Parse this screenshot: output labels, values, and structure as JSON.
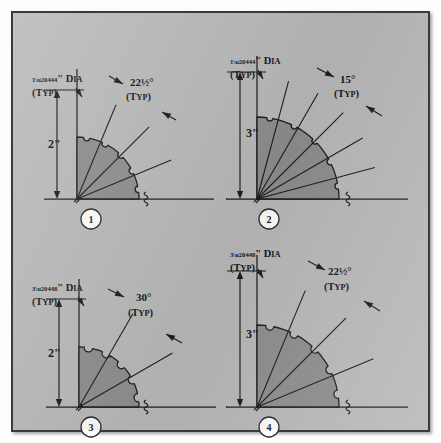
{
  "figure": {
    "background_color": "#b9b9b9",
    "fan_fill_color": "#8e8e8e",
    "line_color": "#1c1c1c",
    "border_color": "#3a3a3a"
  },
  "panels": [
    {
      "number": "1",
      "dia_fraction_num": "1",
      "dia_fraction_den": "4",
      "dia_label": "\" D",
      "dia_label_small": "IA",
      "dia_typ": "(T",
      "dia_typ_small": "YP",
      "dia_typ_end": ")",
      "dia_text": "¼\" DIA (TYP)",
      "radius_label": "2\"",
      "angle_value": "22",
      "angle_fraction": "½",
      "angle_degree": "°",
      "angle_text": "22½°",
      "angle_typ": "(TYP)",
      "angle_step_deg": 22.5,
      "radius_in": 2,
      "hole_dia_in": 0.25
    },
    {
      "number": "2",
      "dia_fraction_num": "1",
      "dia_fraction_den": "4",
      "dia_label": "\" D",
      "dia_label_small": "IA",
      "dia_typ": "(T",
      "dia_typ_small": "YP",
      "dia_typ_end": ")",
      "dia_text": "¼\" DIA (TYP)",
      "radius_label": "3\"",
      "angle_value": "15",
      "angle_fraction": "",
      "angle_degree": "°",
      "angle_text": "15°",
      "angle_typ": "(TYP)",
      "angle_step_deg": 15,
      "radius_in": 3,
      "hole_dia_in": 0.25
    },
    {
      "number": "3",
      "dia_fraction_num": "3",
      "dia_fraction_den": "8",
      "dia_label": "\" D",
      "dia_label_small": "IA",
      "dia_typ": "(T",
      "dia_typ_small": "YP",
      "dia_typ_end": ")",
      "dia_text": "⅜\" DIA (TYP)",
      "radius_label": "2\"",
      "angle_value": "30",
      "angle_fraction": "",
      "angle_degree": "°",
      "angle_text": "30°",
      "angle_typ": "(TYP)",
      "angle_step_deg": 30,
      "radius_in": 2,
      "hole_dia_in": 0.375
    },
    {
      "number": "4",
      "dia_fraction_num": "3",
      "dia_fraction_den": "8",
      "dia_label": "\" D",
      "dia_label_small": "IA",
      "dia_typ": "(T",
      "dia_typ_small": "YP",
      "dia_typ_end": ")",
      "dia_text": "⅜\" DIA (TYP)",
      "radius_label": "3\"",
      "angle_value": "22",
      "angle_fraction": "½",
      "angle_degree": "°",
      "angle_text": "22½°",
      "angle_typ": "(TYP)",
      "angle_step_deg": 22.5,
      "radius_in": 3,
      "hole_dia_in": 0.375
    }
  ]
}
